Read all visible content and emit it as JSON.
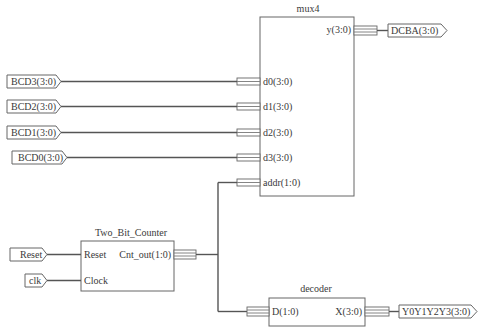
{
  "diagram": {
    "type": "schematic",
    "blocks": {
      "mux4": {
        "title": "mux4",
        "inputs": [
          "d0(3:0)",
          "d1(3:0)",
          "d2(3:0)",
          "d3(3:0)",
          "addr(1:0)"
        ],
        "output": "y(3:0)"
      },
      "counter": {
        "title": "Two_Bit_Counter",
        "inputs": [
          "Reset",
          "Clock"
        ],
        "output": "Cnt_out(1:0)"
      },
      "decoder": {
        "title": "decoder",
        "input": "D(1:0)",
        "output": "X(3:0)"
      }
    },
    "io_ports": {
      "bcd3": "BCD3(3:0)",
      "bcd2": "BCD2(3:0)",
      "bcd1": "BCD1(3:0)",
      "bcd0": "BCD0(3:0)",
      "reset": "Reset",
      "clk": "clk",
      "dcba": "DCBA(3:0)",
      "y_out": "Y0Y1Y2Y3(3:0)"
    },
    "colors": {
      "wire": "#555555",
      "box_border": "#666666",
      "background": "#ffffff"
    }
  }
}
